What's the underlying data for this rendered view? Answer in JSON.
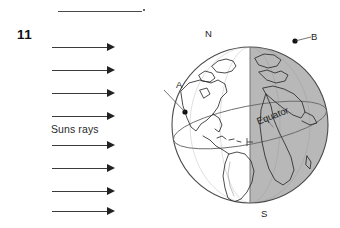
{
  "header": {
    "rule": "",
    "period": ".",
    "question_number": "11"
  },
  "diagram": {
    "rays_label": "Suns rays",
    "ray_count": 8,
    "ray_direction": "right",
    "globe": {
      "north_pole_label": "N",
      "south_pole_label": "S",
      "equator_label": "Equator",
      "point_a_label": "A",
      "point_b_label": "B",
      "day_side": "left",
      "night_side": "right",
      "night_color": "#b8b8b8",
      "outline_color": "#4a4a4a",
      "coastline_color": "#2b2b2b"
    }
  }
}
